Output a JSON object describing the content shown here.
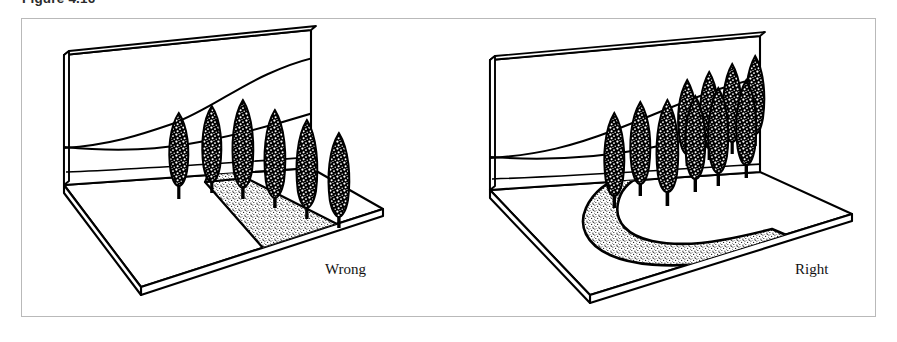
{
  "figure": {
    "caption": "Figure 4.16",
    "frame_color": "#b9b9b9",
    "ink_color": "#000000",
    "background_color": "#ffffff"
  },
  "scenes": [
    {
      "id": "wrong",
      "label": "Wrong",
      "path_shape": "straight",
      "path_description": "straight stippled walkway running diagonally across the ground plane",
      "tree_count": 6,
      "tree_arrangement": "evenly spaced single straight row",
      "tree_type": "cypress",
      "backdrop": "hillside contour lines on vertical back wall"
    },
    {
      "id": "right",
      "label": "Right",
      "path_shape": "curved",
      "path_description": "S-curved stippled walkway sweeping across the ground plane",
      "tree_count": 10,
      "tree_arrangement": "irregular informal cluster of varied heights",
      "tree_type": "cypress",
      "backdrop": "hillside contour lines on vertical back wall"
    }
  ],
  "stipple": {
    "dot_color": "#1a1a1a",
    "pattern": "fine random dot fill"
  }
}
